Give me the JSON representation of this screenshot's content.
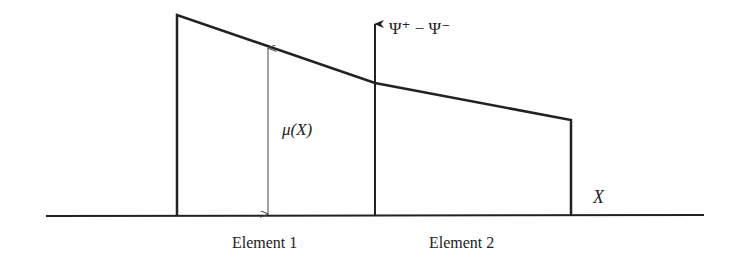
{
  "diagram": {
    "axis_label": "Ψ⁺ − Ψ⁻",
    "x_label": "X",
    "mu_label": "μ(X)",
    "elements": [
      {
        "label": "Element 1"
      },
      {
        "label": "Element 2"
      }
    ],
    "colors": {
      "line": "#222222",
      "background": "#ffffff"
    }
  }
}
